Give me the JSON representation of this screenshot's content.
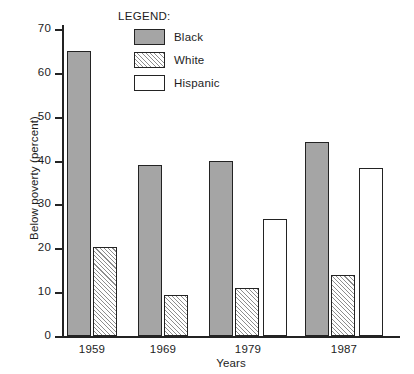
{
  "chart_data": {
    "type": "bar",
    "title": "",
    "xlabel": "Years",
    "ylabel": "Below poverty (percent)",
    "categories": [
      "1959",
      "1969",
      "1979",
      "1987"
    ],
    "series": [
      {
        "name": "Black",
        "values": [
          65.0,
          39.0,
          40.0,
          44.2
        ]
      },
      {
        "name": "White",
        "values": [
          20.3,
          9.3,
          11.0,
          14.0
        ]
      },
      {
        "name": "Hispanic",
        "values": [
          null,
          null,
          26.7,
          38.4
        ]
      }
    ],
    "ylim": [
      0,
      70
    ],
    "yticks": [
      0,
      10,
      20,
      30,
      40,
      50,
      60,
      70
    ],
    "ytick_labels": [
      "0",
      "10",
      "20",
      "30",
      "40",
      "50",
      "60",
      "70"
    ],
    "grid": false,
    "legend": {
      "title": "LEGEND:",
      "position": "top-center",
      "entries": [
        {
          "label": "Black",
          "fill": "solid-gray",
          "color": "#a5a5a5"
        },
        {
          "label": "White",
          "fill": "diagonal-hatch",
          "color": "#ffffff"
        },
        {
          "label": "Hispanic",
          "fill": "empty",
          "color": "#ffffff"
        }
      ]
    }
  },
  "axes": {
    "y_title": "Below poverty (percent)",
    "x_title": "Years",
    "y_ticks": [
      "70",
      "60",
      "50",
      "40",
      "30",
      "20",
      "10",
      "0"
    ],
    "x_groups": [
      "1959",
      "1969",
      "1979",
      "1987"
    ]
  },
  "legend": {
    "title": "LEGEND:",
    "items": [
      {
        "label": "Black"
      },
      {
        "label": "White"
      },
      {
        "label": "Hispanic"
      }
    ]
  },
  "colors": {
    "black_series": "#a5a5a5",
    "white_series": "#ffffff",
    "hispanic_series": "#ffffff",
    "outline": "#232323",
    "background": "#ffffff"
  }
}
